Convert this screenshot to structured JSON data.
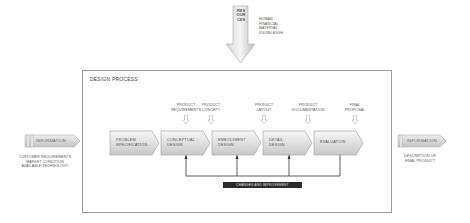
{
  "resources": {
    "label": "RESOURCES",
    "items": [
      "HUMAN",
      "FINANCIAL",
      "MATERIAL",
      "KNOWLEDGE"
    ]
  },
  "frame": {
    "title": "DESIGN PROCESS"
  },
  "deliverables": [
    {
      "line1": "PRODUCT",
      "line2": "REQUIREMENTS"
    },
    {
      "line1": "PRODUCT",
      "line2": "CONCEPT"
    },
    {
      "line1": "PRODUCT",
      "line2": "LAYOUT"
    },
    {
      "line1": "PRODUCT",
      "line2": "DOCUMENTATION"
    },
    {
      "line1": "FINAL",
      "line2": "PROPOSAL"
    }
  ],
  "steps": [
    {
      "line1": "PROBLEM",
      "line2": "SPECIFICATION"
    },
    {
      "line1": "CONCEPTUAL",
      "line2": "DESIGN"
    },
    {
      "line1": "EMBODIMENT",
      "line2": "DESIGN"
    },
    {
      "line1": "DETAIL",
      "line2": "DESIGN"
    },
    {
      "line1": "EVALUATION",
      "line2": ""
    }
  ],
  "feedback": {
    "label": "CHANGES AND IMPROVEMENT"
  },
  "input_info": {
    "label": "INFORMATION",
    "lines": [
      "CUSTOMER REQUIREMENTS",
      "MARKET CONDITION",
      "AVAILABLE TECHNOLOGY"
    ]
  },
  "output_info": {
    "label": "INFORMATION",
    "lines": [
      "DESCRIPTION OF",
      "FINAL PRODUCT"
    ]
  },
  "colors": {
    "step_fill_top": "#f4f4f4",
    "step_fill_bottom": "#c9c9c9",
    "step_stroke": "#9a9a9a",
    "frame_stroke": "#9a9a9a",
    "feedback_bar": "#2b2b2b",
    "connector": "#333333"
  }
}
